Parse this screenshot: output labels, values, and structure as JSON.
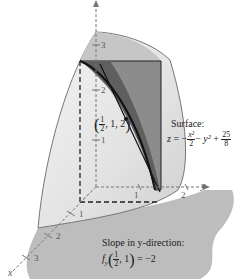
{
  "figure": {
    "type": "3d-surface-with-trace",
    "surface_label": "Surface:",
    "surface_equation": {
      "lhs": "z",
      "eq": "=",
      "minus1": "−",
      "term1_num": "x²",
      "term1_den": "2",
      "minus2": "−",
      "term2": "y²",
      "plus": "+",
      "term3_num": "25",
      "term3_den": "8"
    },
    "point_label": {
      "open": "(",
      "x_num": "1",
      "x_den": "2",
      "rest": ", 1, 2",
      "close": ")"
    },
    "slope_label": "Slope in y-direction:",
    "slope_equation": {
      "func": "f",
      "sub": "y",
      "open": "(",
      "x_num": "1",
      "x_den": "2",
      "rest": ", 1",
      "close": ")",
      "result": "= −2"
    },
    "axes": {
      "x_label": "x",
      "y_label": "y",
      "z_label": "z",
      "z_ticks": [
        "3",
        "2",
        "1"
      ],
      "y_ticks": [
        "1",
        "2"
      ],
      "x_ticks": [
        "1",
        "2",
        "3"
      ]
    },
    "colors": {
      "surface_light": "#e8e8e8",
      "surface_top": "#c8c8c8",
      "plane": "#8a8a8a",
      "plane_dark": "#666666",
      "ground": "#bdbdbd",
      "curve": "#111111"
    }
  }
}
